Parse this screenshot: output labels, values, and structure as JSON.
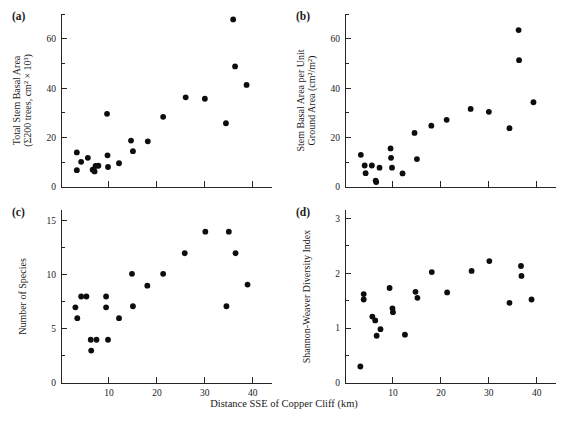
{
  "figure": {
    "xlabel": "Distance SSE of Copper Cliff (km)"
  },
  "chart_data": [
    {
      "type": "scatter",
      "panel": "(a)",
      "title": "",
      "xlabel": "Distance SSE of Copper Cliff (km)",
      "ylabel_line1": "Total Stem Basal Area",
      "ylabel_line2": "(Σ200 trees, cm² × 10³)",
      "xlim": [
        0,
        44
      ],
      "ylim": [
        0,
        70
      ],
      "xticks": [
        0,
        10,
        20,
        30,
        40
      ],
      "xticklabels": [
        "",
        "",
        "",
        "",
        ""
      ],
      "xminorticks": [
        5,
        15,
        25,
        35
      ],
      "yticks": [
        0,
        20,
        40,
        60
      ],
      "yticklabels": [
        "0",
        "20",
        "40",
        "60"
      ],
      "yminorticks": [
        10,
        30,
        50,
        70
      ],
      "grid": false,
      "points": [
        {
          "x": 3.3,
          "y": 14.0
        },
        {
          "x": 3.3,
          "y": 6.8
        },
        {
          "x": 4.2,
          "y": 10.2
        },
        {
          "x": 5.6,
          "y": 11.8
        },
        {
          "x": 6.6,
          "y": 7.0
        },
        {
          "x": 7.0,
          "y": 6.3
        },
        {
          "x": 7.2,
          "y": 8.5
        },
        {
          "x": 7.8,
          "y": 8.6
        },
        {
          "x": 9.6,
          "y": 29.6
        },
        {
          "x": 9.7,
          "y": 12.8
        },
        {
          "x": 9.8,
          "y": 8.1
        },
        {
          "x": 12.1,
          "y": 9.6
        },
        {
          "x": 14.6,
          "y": 18.8
        },
        {
          "x": 15.0,
          "y": 14.5
        },
        {
          "x": 18.1,
          "y": 18.5
        },
        {
          "x": 21.3,
          "y": 28.4
        },
        {
          "x": 26.0,
          "y": 36.3
        },
        {
          "x": 30.0,
          "y": 35.7
        },
        {
          "x": 34.4,
          "y": 25.8
        },
        {
          "x": 35.9,
          "y": 67.8
        },
        {
          "x": 36.3,
          "y": 48.8
        },
        {
          "x": 38.7,
          "y": 41.3
        }
      ]
    },
    {
      "type": "scatter",
      "panel": "(b)",
      "title": "",
      "xlabel": "Distance SSE of Copper Cliff (km)",
      "ylabel_line1": "Stem Basal Area per Unit",
      "ylabel_line2": "Ground Area (cm²/m²)",
      "xlim": [
        0,
        44
      ],
      "ylim": [
        0,
        70
      ],
      "xticks": [
        0,
        10,
        20,
        30,
        40
      ],
      "xticklabels": [
        "",
        "",
        "",
        "",
        ""
      ],
      "xminorticks": [
        5,
        15,
        25,
        35
      ],
      "yticks": [
        0,
        20,
        40,
        60
      ],
      "yticklabels": [
        "0",
        "20",
        "40",
        "60"
      ],
      "yminorticks": [
        10,
        30,
        50,
        70
      ],
      "grid": false,
      "points": [
        {
          "x": 3.3,
          "y": 13.0
        },
        {
          "x": 4.1,
          "y": 8.7
        },
        {
          "x": 4.3,
          "y": 5.6
        },
        {
          "x": 5.6,
          "y": 8.7
        },
        {
          "x": 6.4,
          "y": 2.6
        },
        {
          "x": 6.5,
          "y": 2.0
        },
        {
          "x": 7.2,
          "y": 7.8
        },
        {
          "x": 9.5,
          "y": 15.6
        },
        {
          "x": 9.6,
          "y": 11.8
        },
        {
          "x": 9.8,
          "y": 7.8
        },
        {
          "x": 12.0,
          "y": 5.5
        },
        {
          "x": 14.5,
          "y": 21.9
        },
        {
          "x": 15.0,
          "y": 11.3
        },
        {
          "x": 18.0,
          "y": 24.8
        },
        {
          "x": 21.2,
          "y": 27.2
        },
        {
          "x": 26.2,
          "y": 31.6
        },
        {
          "x": 30.0,
          "y": 30.4
        },
        {
          "x": 34.3,
          "y": 23.8
        },
        {
          "x": 36.2,
          "y": 63.5
        },
        {
          "x": 36.3,
          "y": 51.3
        },
        {
          "x": 39.3,
          "y": 34.3
        }
      ]
    },
    {
      "type": "scatter",
      "panel": "(c)",
      "title": "",
      "xlabel": "Distance SSE of Copper Cliff (km)",
      "ylabel_line1": "Number of Species",
      "ylabel_line2": "",
      "xlim": [
        0,
        44
      ],
      "ylim": [
        0,
        16
      ],
      "xticks": [
        0,
        10,
        20,
        30,
        40
      ],
      "xticklabels": [
        "0",
        "10",
        "20",
        "30",
        "40"
      ],
      "xminorticks": [
        5,
        15,
        25,
        35
      ],
      "yticks": [
        0,
        5,
        10,
        15
      ],
      "yticklabels": [
        "0",
        "5",
        "10",
        "15"
      ],
      "yminorticks": [
        2.5,
        7.5,
        12.5
      ],
      "grid": false,
      "points": [
        {
          "x": 3.0,
          "y": 7.0
        },
        {
          "x": 3.4,
          "y": 6.0
        },
        {
          "x": 4.2,
          "y": 8.0
        },
        {
          "x": 5.3,
          "y": 8.0
        },
        {
          "x": 6.2,
          "y": 4.0
        },
        {
          "x": 6.3,
          "y": 3.0
        },
        {
          "x": 7.4,
          "y": 4.0
        },
        {
          "x": 9.4,
          "y": 8.0
        },
        {
          "x": 9.4,
          "y": 7.0
        },
        {
          "x": 9.8,
          "y": 4.0
        },
        {
          "x": 12.1,
          "y": 6.0
        },
        {
          "x": 14.8,
          "y": 10.1
        },
        {
          "x": 15.0,
          "y": 7.1
        },
        {
          "x": 18.0,
          "y": 9.0
        },
        {
          "x": 21.3,
          "y": 10.1
        },
        {
          "x": 25.8,
          "y": 12.0
        },
        {
          "x": 30.1,
          "y": 14.0
        },
        {
          "x": 34.5,
          "y": 7.1
        },
        {
          "x": 35.0,
          "y": 14.0
        },
        {
          "x": 36.4,
          "y": 12.0
        },
        {
          "x": 38.9,
          "y": 9.1
        }
      ]
    },
    {
      "type": "scatter",
      "panel": "(d)",
      "title": "",
      "xlabel": "Distance SSE of Copper Cliff (km)",
      "ylabel_line1": "Shannon-Weaver Diversity Index",
      "ylabel_line2": "",
      "xlim": [
        0,
        44
      ],
      "ylim": [
        0,
        3.15
      ],
      "xticks": [
        0,
        10,
        20,
        30,
        40
      ],
      "xticklabels": [
        "0",
        "10",
        "20",
        "30",
        "40"
      ],
      "xminorticks": [
        5,
        15,
        25,
        35
      ],
      "yticks": [
        0,
        1,
        2,
        3
      ],
      "yticklabels": [
        "0",
        "1",
        "2",
        "3"
      ],
      "yminorticks": [
        0.5,
        1.5,
        2.5
      ],
      "grid": false,
      "points": [
        {
          "x": 3.2,
          "y": 0.3
        },
        {
          "x": 3.9,
          "y": 1.62
        },
        {
          "x": 3.9,
          "y": 1.52
        },
        {
          "x": 5.7,
          "y": 1.21
        },
        {
          "x": 6.3,
          "y": 1.14
        },
        {
          "x": 6.6,
          "y": 0.86
        },
        {
          "x": 7.4,
          "y": 0.98
        },
        {
          "x": 9.3,
          "y": 1.73
        },
        {
          "x": 9.9,
          "y": 1.36
        },
        {
          "x": 10.0,
          "y": 1.29
        },
        {
          "x": 12.5,
          "y": 0.88
        },
        {
          "x": 14.7,
          "y": 1.66
        },
        {
          "x": 15.1,
          "y": 1.55
        },
        {
          "x": 18.1,
          "y": 2.02
        },
        {
          "x": 21.3,
          "y": 1.65
        },
        {
          "x": 26.4,
          "y": 2.04
        },
        {
          "x": 30.1,
          "y": 2.22
        },
        {
          "x": 34.3,
          "y": 1.46
        },
        {
          "x": 36.7,
          "y": 2.13
        },
        {
          "x": 36.8,
          "y": 1.95
        },
        {
          "x": 38.9,
          "y": 1.52
        }
      ]
    }
  ]
}
